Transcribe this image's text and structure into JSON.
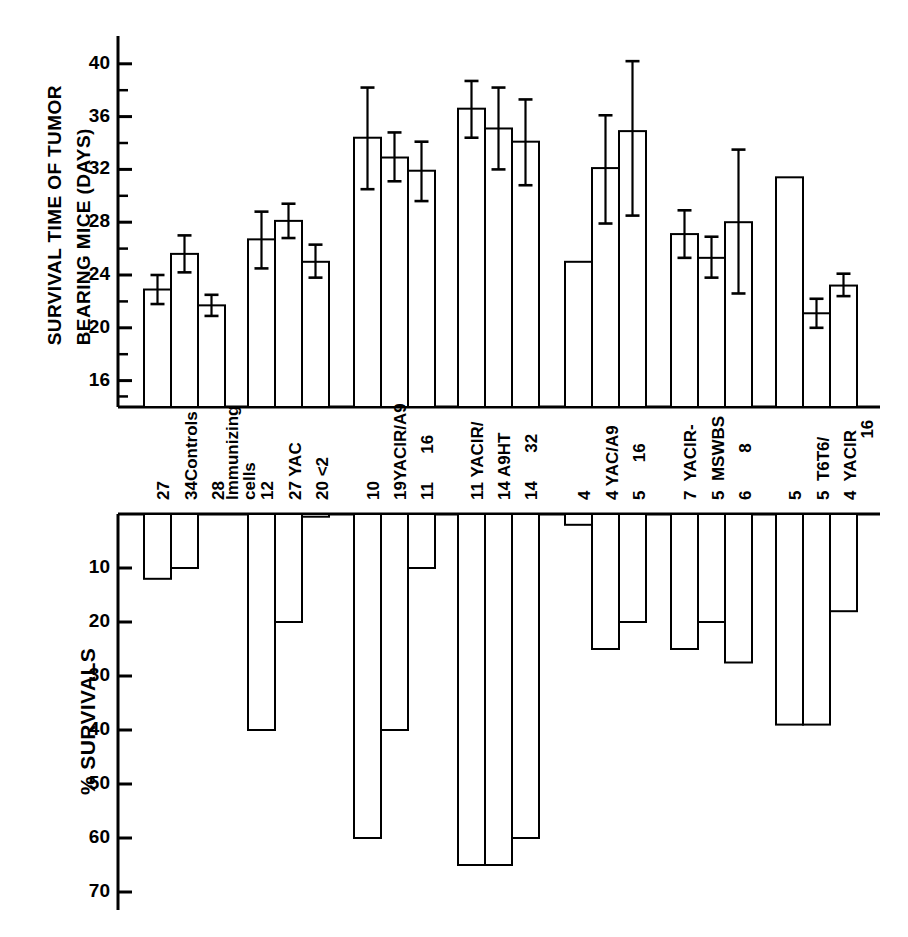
{
  "figure": {
    "top_axis_title": "SURVIVAL TIME OF TUMOR\nBEARING MICE (DAYS)",
    "bottom_axis_title": "% SURVIVALS"
  },
  "chart_data": {
    "type": "bar",
    "title": "",
    "panels": [
      {
        "name": "survival-time-panel",
        "ylabel": "SURVIVAL TIME OF TUMOR BEARING MICE (DAYS)",
        "ylim": [
          14,
          41
        ],
        "yticks": [
          16,
          20,
          24,
          28,
          32,
          36,
          40
        ],
        "ytick_labels": [
          "16",
          "20",
          "24",
          "28",
          "32",
          "36",
          "40"
        ],
        "minor_ticks": [
          18,
          22,
          26,
          30,
          34,
          38
        ],
        "grid": false,
        "direction": "up",
        "error_bars": true
      },
      {
        "name": "percent-survivals-panel",
        "ylabel": "% SURVIVALS",
        "ylim": [
          0,
          70
        ],
        "yticks": [
          10,
          20,
          30,
          40,
          50,
          60,
          70
        ],
        "ytick_labels": [
          "10",
          "20",
          "30",
          "40",
          "50",
          "60",
          "70"
        ],
        "grid": false,
        "direction": "down",
        "error_bars": false
      }
    ],
    "groups": [
      {
        "group_label": "Controls",
        "bars": [
          {
            "n": "27",
            "label": "",
            "survival_days": 22.9,
            "err_low": 21.8,
            "err_high": 24.0,
            "percent_survival": 12.0
          },
          {
            "n": "34",
            "label": "Controls",
            "survival_days": 25.6,
            "err_low": 24.2,
            "err_high": 27.0,
            "percent_survival": 10.0
          },
          {
            "n": "28",
            "label": "",
            "survival_days": 21.7,
            "err_low": 20.9,
            "err_high": 22.5,
            "percent_survival": 0.0
          }
        ]
      },
      {
        "group_label": "YAC",
        "bars": [
          {
            "n": "12",
            "label": "Immunizing cells",
            "survival_days": 26.7,
            "err_low": 24.5,
            "err_high": 28.8,
            "percent_survival": 40.0
          },
          {
            "n": "27",
            "label": "YAC",
            "survival_days": 28.1,
            "err_low": 26.8,
            "err_high": 29.4,
            "percent_survival": 20.0
          },
          {
            "n": "20",
            "label": "< 2",
            "survival_days": 25.0,
            "err_low": 23.8,
            "err_high": 26.3,
            "percent_survival": 0.5
          }
        ]
      },
      {
        "group_label": "YACIR/A9",
        "bars": [
          {
            "n": "10",
            "label": "",
            "survival_days": 34.4,
            "err_low": 30.5,
            "err_high": 38.2,
            "percent_survival": 60.0
          },
          {
            "n": "19",
            "label": "YACIR/A9",
            "survival_days": 32.9,
            "err_low": 31.1,
            "err_high": 34.8,
            "percent_survival": 40.0
          },
          {
            "n": "11",
            "label": "16",
            "survival_days": 31.9,
            "err_low": 29.6,
            "err_high": 34.1,
            "percent_survival": 10.0
          }
        ]
      },
      {
        "group_label": "YACIR/A9HT",
        "bars": [
          {
            "n": "11",
            "label": "YACIR/",
            "survival_days": 36.6,
            "err_low": 34.4,
            "err_high": 38.7,
            "percent_survival": 65.0
          },
          {
            "n": "14",
            "label": "A9HT",
            "survival_days": 35.1,
            "err_low": 32.0,
            "err_high": 38.2,
            "percent_survival": 65.0
          },
          {
            "n": "14",
            "label": "32",
            "survival_days": 34.1,
            "err_low": 30.8,
            "err_high": 37.3,
            "percent_survival": 60.0
          }
        ]
      },
      {
        "group_label": "YAC/A9",
        "bars": [
          {
            "n": "4",
            "label": "",
            "survival_days": 25.0,
            "err_low": null,
            "err_high": null,
            "percent_survival": 2.0
          },
          {
            "n": "4",
            "label": "YAC/A9",
            "survival_days": 32.1,
            "err_low": 27.9,
            "err_high": 36.1,
            "percent_survival": 25.0
          },
          {
            "n": "5",
            "label": "16",
            "survival_days": 34.9,
            "err_low": 28.5,
            "err_high": 40.2,
            "percent_survival": 20.0
          }
        ]
      },
      {
        "group_label": "YACIR-MSWBS",
        "bars": [
          {
            "n": "7",
            "label": "YACIR-",
            "survival_days": 27.1,
            "err_low": 25.3,
            "err_high": 28.9,
            "percent_survival": 25.0
          },
          {
            "n": "5",
            "label": "MSWBS",
            "survival_days": 25.3,
            "err_low": 23.8,
            "err_high": 26.9,
            "percent_survival": 20.0
          },
          {
            "n": "6",
            "label": "8",
            "survival_days": 28.0,
            "err_low": 22.6,
            "err_high": 33.5,
            "percent_survival": 27.5
          }
        ]
      },
      {
        "group_label": "T6T6/YACIR",
        "bars": [
          {
            "n": "5",
            "label": "",
            "survival_days": 31.4,
            "err_low": null,
            "err_high": null,
            "percent_survival": 39.0
          },
          {
            "n": "5",
            "label": "T6T6/",
            "survival_days": 21.1,
            "err_low": 20.0,
            "err_high": 22.2,
            "percent_survival": 39.0
          },
          {
            "n": "4",
            "label": "YACIR 16",
            "survival_days": 23.2,
            "err_low": 22.4,
            "err_high": 24.1,
            "percent_survival": 18.0
          }
        ]
      }
    ],
    "category_text_blocks": [
      {
        "id": "blk-34controls",
        "text": "34Controls"
      },
      {
        "id": "blk-27",
        "text": "27"
      },
      {
        "id": "blk-28",
        "text": "28"
      },
      {
        "id": "blk-immunizing",
        "text": "Immunizing\ncells"
      },
      {
        "id": "blk-12",
        "text": "12"
      },
      {
        "id": "blk-27yac",
        "text": "27 YAC"
      },
      {
        "id": "blk-20lt2",
        "text": "20 <2"
      },
      {
        "id": "blk-10",
        "text": "10"
      },
      {
        "id": "blk-19yacira9",
        "text": "19YACIR/A9"
      },
      {
        "id": "blk-11-16",
        "text": "11    16"
      },
      {
        "id": "blk-11yacir",
        "text": "11 YACIR/"
      },
      {
        "id": "blk-14a9ht",
        "text": "14 A9HT"
      },
      {
        "id": "blk-14-32",
        "text": "14    32"
      },
      {
        "id": "blk-4",
        "text": "4"
      },
      {
        "id": "blk-4yaca9",
        "text": "4 YAC/A9"
      },
      {
        "id": "blk-5-16",
        "text": "5    16"
      },
      {
        "id": "blk-7yacir",
        "text": "7  YACIR-"
      },
      {
        "id": "blk-5mswbs",
        "text": "5  MSWBS"
      },
      {
        "id": "blk-6-8",
        "text": "6      8"
      },
      {
        "id": "blk-5b",
        "text": "5"
      },
      {
        "id": "blk-5t6t6",
        "text": "5  T6T6/"
      },
      {
        "id": "blk-4yacir",
        "text": "4  YACIR\n         16"
      }
    ]
  }
}
